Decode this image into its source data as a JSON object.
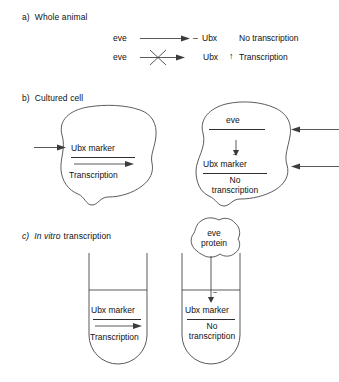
{
  "figure": {
    "type": "biology-schematic"
  },
  "panels": [
    {
      "id": "a",
      "label": "a)",
      "title": "Whole animal",
      "title_italic": false,
      "rows": [
        {
          "source": "eve",
          "arrow": "plain-arrow",
          "sign": "–",
          "target": "Ubx",
          "target_marker": "",
          "outcome": "No transcription"
        },
        {
          "source": "eve",
          "arrow": "crossed-arrow",
          "sign": "",
          "target": "Ubx",
          "target_marker": "↑",
          "outcome": "Transcription"
        }
      ]
    },
    {
      "id": "b",
      "label": "b)",
      "title": "Cultured cell",
      "title_italic": false,
      "cells": [
        {
          "name": "left-cell",
          "gene_label": "",
          "marker": "Ubx marker",
          "result_line1": "Transcription",
          "result_line2": "",
          "internal_arrow": "right",
          "inbound_arrows": 1
        },
        {
          "name": "right-cell",
          "gene_label": "eve",
          "marker": "Ubx marker",
          "result_line1": "No",
          "result_line2": "transcription",
          "internal_arrow": "down-blocked",
          "inbound_arrows": 2
        }
      ]
    },
    {
      "id": "c",
      "label": "c)",
      "title_italic_part": "In vitro",
      "title_plain_part": "transcription",
      "tubes": [
        {
          "name": "left-tube",
          "protein_line1": "",
          "protein_line2": "",
          "marker": "Ubx marker",
          "result_line1": "Transcription",
          "result_line2": "",
          "internal_arrow": "right"
        },
        {
          "name": "right-tube",
          "protein_line1": "eve",
          "protein_line2": "protein",
          "sign": "–",
          "marker": "Ubx marker",
          "result_line1": "No",
          "result_line2": "transcription",
          "internal_arrow": "down"
        }
      ]
    }
  ],
  "colors": {
    "ink": "#1a1a1a",
    "line": "#3b3b3b",
    "background": "#ffffff"
  }
}
